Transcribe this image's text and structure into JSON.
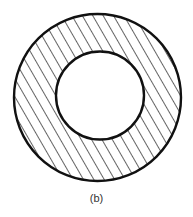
{
  "figure": {
    "caption": "(b)",
    "shape": "annulus",
    "fill_pattern": "diagonal-hatch",
    "outer_circle": {
      "cx": 97.5,
      "cy": 97.5,
      "r": 83.5
    },
    "inner_circle": {
      "cx": 100,
      "cy": 95.5,
      "r": 44
    },
    "hatch": {
      "spacing": 9,
      "angle_deg": 60
    },
    "stroke_color": "#111111",
    "background_color": "#ffffff"
  }
}
